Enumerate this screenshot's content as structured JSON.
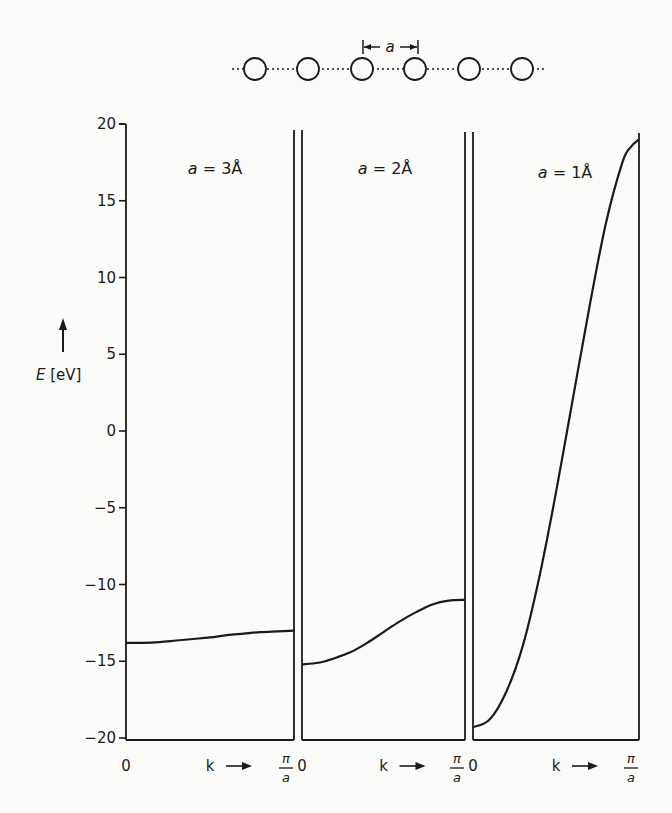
{
  "chart_data": {
    "type": "line",
    "title": "",
    "ylabel": "E [eV]",
    "xlabel": "k",
    "ylim": [
      -20,
      20
    ],
    "yticks": [
      20,
      15,
      10,
      5,
      0,
      -5,
      -10,
      -15,
      -20
    ],
    "x_tick_labels": {
      "start": "0",
      "arrow": "k →",
      "end_num": "π",
      "end_den": "a"
    },
    "grid": false,
    "legend": null,
    "lattice_diagram": {
      "atoms": 6,
      "spacing_label": "a"
    },
    "panels": [
      {
        "label": "a = 3Å",
        "lattice_constant_angstrom": 3,
        "x": [
          0,
          0.1,
          0.2,
          0.3,
          0.4,
          0.5,
          0.6,
          0.7,
          0.8,
          0.9,
          1.0
        ],
        "E": [
          -13.8,
          -13.8,
          -13.75,
          -13.65,
          -13.55,
          -13.45,
          -13.3,
          -13.2,
          -13.1,
          -13.05,
          -13.0
        ]
      },
      {
        "label": "a = 2Å",
        "lattice_constant_angstrom": 2,
        "x": [
          0,
          0.1,
          0.2,
          0.3,
          0.4,
          0.5,
          0.6,
          0.7,
          0.8,
          0.9,
          1.0
        ],
        "E": [
          -15.2,
          -15.1,
          -14.8,
          -14.4,
          -13.8,
          -13.1,
          -12.4,
          -11.8,
          -11.3,
          -11.05,
          -11.0
        ]
      },
      {
        "label": "a = 1Å",
        "lattice_constant_angstrom": 1,
        "x": [
          0,
          0.1,
          0.2,
          0.3,
          0.4,
          0.5,
          0.6,
          0.7,
          0.8,
          0.9,
          0.95,
          1.0
        ],
        "E": [
          -19.3,
          -18.8,
          -17.0,
          -14.0,
          -9.5,
          -4.0,
          2.0,
          8.0,
          13.5,
          17.5,
          18.5,
          19.0
        ]
      }
    ]
  },
  "labels": {
    "y_axis": "E [eV]",
    "spacing": "a",
    "zero": "0",
    "k": "k",
    "pi": "π",
    "a_den": "a"
  }
}
